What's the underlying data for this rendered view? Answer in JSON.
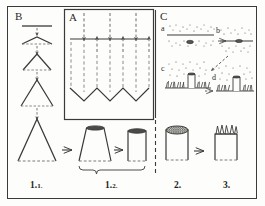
{
  "figure": {
    "panels": [
      {
        "id": "B",
        "label": "B",
        "caption_role": "cone-formation-sequence"
      },
      {
        "id": "A",
        "label": "A",
        "caption_role": "infiltration-sawtooth-diagram"
      },
      {
        "id": "C",
        "label": "C",
        "caption_role": "soil-seed-germination-sequence"
      }
    ],
    "panel_c_substeps": [
      {
        "key": "a",
        "label": "a"
      },
      {
        "key": "b",
        "label": "b"
      },
      {
        "key": "c",
        "label": "c"
      },
      {
        "key": "d",
        "label": "d"
      }
    ],
    "step_labels": [
      {
        "key": "s11",
        "main": "1.",
        "sub": "1."
      },
      {
        "key": "s12",
        "main": "1.",
        "sub": "2."
      },
      {
        "key": "s2",
        "main": "2.",
        "sub": ""
      },
      {
        "key": "s3",
        "main": "3.",
        "sub": ""
      }
    ],
    "colors": {
      "ink": "#2b2b29",
      "frame": "#3a3a38",
      "dashed": "#5a5a57",
      "stipple": "#4a4a47",
      "fill": "#fdfdfb"
    }
  }
}
